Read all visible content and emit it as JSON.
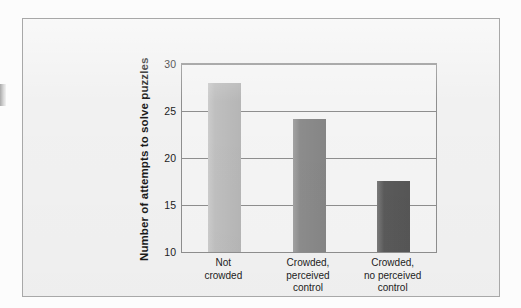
{
  "figure": {
    "background_color": "#f1f1f1",
    "frame_color": "#a8a8a8"
  },
  "chart_data": {
    "type": "bar",
    "title": "",
    "xlabel": "",
    "ylabel": "Number of attempts to solve puzzles",
    "categories": [
      "Not\ncrowded",
      "Crowded,\nperceived\ncontrol",
      "Crowded,\nno perceived\ncontrol"
    ],
    "values": [
      28.0,
      24.2,
      17.6
    ],
    "bar_colors": [
      "#bfbfbf",
      "#8c8c8c",
      "#5a5a5a"
    ],
    "ylim": [
      10,
      30
    ],
    "yticks": [
      10,
      15,
      20,
      25,
      30
    ],
    "ytick_labels": [
      "10",
      "15",
      "20",
      "25",
      "30"
    ],
    "grid": true,
    "grid_color": "#8e8e8e",
    "legend": null,
    "legend_position": "none",
    "annotations": []
  }
}
